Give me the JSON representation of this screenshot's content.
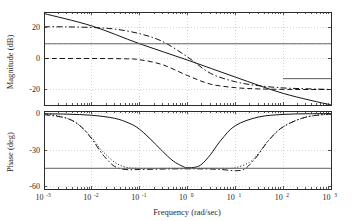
{
  "figure": {
    "kind": "bode-plot",
    "background_color": "#ffffff",
    "line_color": "#151515",
    "grid_color": "#b9b9b9"
  },
  "xaxis": {
    "label": "Frequency  (rad/sec)",
    "scale": "log",
    "min_exponent": -3,
    "max_exponent": 3,
    "tick_mantissa": "10",
    "tick_exponents": [
      "-3",
      "-2",
      "-1",
      "0",
      "1",
      "2",
      "3"
    ],
    "tick_values": [
      0.001,
      0.01,
      0.1,
      1,
      10,
      100,
      1000
    ]
  },
  "panels": [
    {
      "id": "magnitude",
      "ylabel": "Magnitude (dB)",
      "yticks": [
        20,
        0,
        -20
      ],
      "ytick_labels": [
        "20",
        "0",
        "-20"
      ],
      "ylim": [
        -30,
        30
      ],
      "grid": true
    },
    {
      "id": "phase",
      "ylabel": "Phase (deg)",
      "yticks": [
        0,
        -30,
        -60
      ],
      "ytick_labels": [
        "0",
        "-30",
        "-60"
      ],
      "ylim": [
        -62,
        2
      ],
      "grid": true
    }
  ],
  "chart_data": {
    "type": "line",
    "title": "",
    "xlabel": "Frequency  (rad/sec)",
    "subplots": [
      {
        "name": "magnitude",
        "ylabel": "Magnitude (dB)",
        "ylim": [
          -30,
          30
        ],
        "yticks": [
          20,
          0,
          -20
        ],
        "xlim": [
          0.001,
          1000
        ],
        "xscale": "log",
        "grid": true,
        "series": [
          {
            "name": "integrator-rolloff",
            "style": "solid",
            "x": [
              0.001,
              0.01,
              0.1,
              1,
              10,
              100,
              1000
            ],
            "y": [
              29,
              21,
              9.5,
              -1,
              -12,
              -22.5,
              -30
            ]
          },
          {
            "name": "lag-compensated",
            "style": "dash-dot",
            "x": [
              0.001,
              0.003,
              0.01,
              0.03,
              0.1,
              0.3,
              1,
              3,
              10,
              30,
              100,
              300,
              1000
            ],
            "y": [
              20.5,
              20.4,
              20.0,
              19.0,
              16.0,
              11.0,
              1.0,
              -9.5,
              -15.0,
              -17.5,
              -19.0,
              -19.5,
              -20.0
            ]
          },
          {
            "name": "uncompensated-gain",
            "style": "solid-light",
            "x": [
              0.001,
              0.1,
              1,
              10,
              100,
              1000
            ],
            "y": [
              9.5,
              9.5,
              9.5,
              9.5,
              9.5,
              9.5
            ]
          },
          {
            "name": "low-gain-plant",
            "style": "dashed",
            "x": [
              0.001,
              0.01,
              0.05,
              0.1,
              0.3,
              1,
              3,
              10,
              30,
              100,
              300,
              1000
            ],
            "y": [
              0.0,
              0.0,
              -0.2,
              -0.8,
              -4.0,
              -11.0,
              -16.5,
              -18.8,
              -19.6,
              -19.9,
              -20.0,
              -20.0
            ]
          },
          {
            "name": "high-frequency-asymptote",
            "style": "solid-light",
            "x": [
              100,
              1000
            ],
            "y": [
              -13.0,
              -13.0
            ]
          }
        ]
      },
      {
        "name": "phase",
        "ylabel": "Phase (deg)",
        "ylim": [
          -62,
          2
        ],
        "yticks": [
          0,
          -30,
          -60
        ],
        "xlim": [
          0.001,
          1000
        ],
        "xscale": "log",
        "grid": true,
        "series": [
          {
            "name": "notch-phase-solid",
            "style": "solid",
            "x": [
              0.001,
              0.003,
              0.01,
              0.03,
              0.06,
              0.1,
              0.2,
              0.3,
              0.5,
              0.8,
              1,
              1.5,
              2,
              3,
              5,
              10,
              30,
              100,
              300,
              1000
            ],
            "y": [
              -0.3,
              -0.6,
              -1.5,
              -4.0,
              -8.0,
              -13.0,
              -24.0,
              -31.0,
              -39.0,
              -43.5,
              -44.5,
              -44.0,
              -41.5,
              -34.0,
              -22.0,
              -10.0,
              -3.0,
              -0.8,
              -0.3,
              -0.1
            ]
          },
          {
            "name": "lag-phase-dotted",
            "style": "dotted",
            "x": [
              0.001,
              0.002,
              0.004,
              0.006,
              0.01,
              0.015,
              0.02,
              0.03,
              0.05,
              0.1,
              0.5,
              2,
              5,
              10,
              20,
              30,
              50,
              100,
              300,
              1000
            ],
            "y": [
              -0.5,
              -2.0,
              -6.0,
              -11.0,
              -20.0,
              -29.0,
              -34.0,
              -40.0,
              -44.0,
              -45.0,
              -45.0,
              -45.0,
              -45.0,
              -44.5,
              -40.0,
              -33.0,
              -22.0,
              -11.0,
              -3.0,
              -0.5
            ]
          },
          {
            "name": "lag-phase-dashdot",
            "style": "dash-dot",
            "x": [
              0.001,
              0.003,
              0.006,
              0.01,
              0.015,
              0.02,
              0.03,
              0.05,
              0.1,
              0.5,
              2,
              5,
              10,
              15,
              20,
              30,
              50,
              100,
              300,
              1000
            ],
            "y": [
              -1.0,
              -4.0,
              -11.0,
              -21.0,
              -31.0,
              -37.0,
              -43.5,
              -46.0,
              -46.0,
              -45.5,
              -45.5,
              -46.0,
              -47.0,
              -46.0,
              -42.0,
              -34.0,
              -22.0,
              -11.0,
              -3.0,
              -0.5
            ]
          },
          {
            "name": "phase-margin-line",
            "style": "solid-light",
            "x": [
              0.001,
              1000
            ],
            "y": [
              -45.0,
              -45.0
            ]
          }
        ]
      }
    ]
  }
}
